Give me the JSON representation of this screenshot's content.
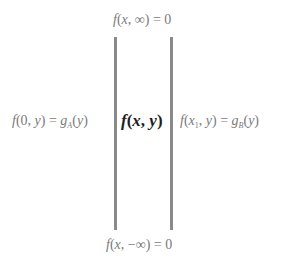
{
  "diagram": {
    "colors": {
      "line": "#8a8a8a",
      "boundary_text": "#7a7a7a",
      "center_text": "#1e1e1e",
      "background": "#ffffff"
    },
    "top_boundary": {
      "fn": "f",
      "args_open": "(",
      "arg1": "x",
      "sep": ", ",
      "arg2": "∞",
      "args_close": ")",
      "eq": " = ",
      "value": "0"
    },
    "bottom_boundary": {
      "fn": "f",
      "args_open": "(",
      "arg1": "x",
      "sep": ", ",
      "arg2": "−∞",
      "args_close": ")",
      "eq": " = ",
      "value": "0"
    },
    "left_boundary": {
      "fn": "f",
      "args_open": "(",
      "arg1": "0",
      "sep": ", ",
      "arg2": "y",
      "args_close": ")",
      "eq": " = ",
      "rhs_fn": "g",
      "rhs_sub": "A",
      "rhs_args_open": "(",
      "rhs_arg": "y",
      "rhs_args_close": ")"
    },
    "right_boundary": {
      "fn": "f",
      "args_open": "(",
      "arg1": "x",
      "arg1_sub": "1",
      "sep": ", ",
      "arg2": "y",
      "args_close": ")",
      "eq": " = ",
      "rhs_fn": "g",
      "rhs_sub": "B",
      "rhs_args_open": "(",
      "rhs_arg": "y",
      "rhs_args_close": ")"
    },
    "interior": {
      "fn": "f",
      "args_open": "(",
      "arg1": "x",
      "sep": ", ",
      "arg2": "y",
      "args_close": ")"
    }
  }
}
